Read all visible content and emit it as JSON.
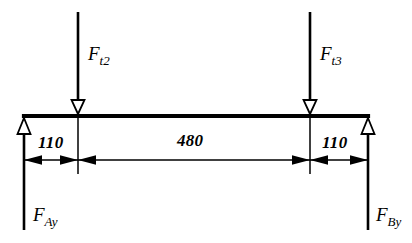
{
  "figure": {
    "background_color": "#ffffff",
    "line_color": "#000000",
    "width": 412,
    "height": 243
  },
  "loads": [
    {
      "name": "left-applied-load",
      "symbol": "F",
      "subscript": "t2",
      "direction": "down",
      "arrow_style": "hollow-triangle",
      "x": 78
    },
    {
      "name": "right-applied-load",
      "symbol": "F",
      "subscript": "t3",
      "direction": "down",
      "arrow_style": "hollow-triangle",
      "x": 310
    }
  ],
  "reactions": [
    {
      "name": "left-support-reaction",
      "symbol": "F",
      "subscript": "Ay",
      "direction": "up",
      "arrow_style": "hollow-triangle",
      "x": 24
    },
    {
      "name": "right-support-reaction",
      "symbol": "F",
      "subscript": "By",
      "direction": "up",
      "arrow_style": "hollow-triangle",
      "x": 368
    }
  ],
  "dimensions": [
    {
      "name": "left-overhang",
      "value": "110",
      "from_x": 24,
      "to_x": 78
    },
    {
      "name": "center-span",
      "value": "480",
      "from_x": 78,
      "to_x": 310
    },
    {
      "name": "right-overhang",
      "value": "110",
      "from_x": 310,
      "to_x": 368
    }
  ],
  "beam": {
    "name": "beam",
    "left_x": 24,
    "right_x": 368,
    "y": 116
  }
}
